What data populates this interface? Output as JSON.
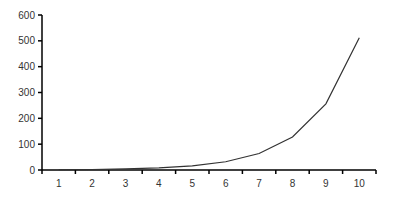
{
  "chart_data": {
    "type": "line",
    "title": "",
    "xlabel": "",
    "ylabel": "",
    "categories": [
      "1",
      "2",
      "3",
      "4",
      "5",
      "6",
      "7",
      "8",
      "9",
      "10"
    ],
    "series": [
      {
        "name": "Series 1",
        "values": [
          1,
          2,
          4,
          8,
          16,
          32,
          64,
          128,
          256,
          512
        ]
      }
    ],
    "ylim": [
      0,
      600
    ],
    "yticks": [
      0,
      100,
      200,
      300,
      400,
      500,
      600
    ],
    "grid": false,
    "legend": "none",
    "line_color": "#333333",
    "axis_color": "#000000"
  }
}
